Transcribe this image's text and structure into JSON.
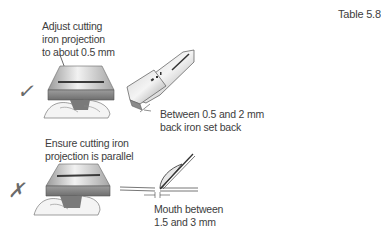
{
  "table_label": "Table 5.8",
  "rows": [
    {
      "status": "correct",
      "status_symbol": "✓",
      "caption": [
        "Adjust cutting",
        "iron projection",
        "to about 0.5 mm"
      ],
      "secondary_caption": [
        "Between 0.5 and 2 mm",
        "back iron set back"
      ]
    },
    {
      "status": "incorrect",
      "status_symbol": "✗",
      "caption": [
        "Ensure cutting iron",
        "projection is parallel"
      ],
      "secondary_caption": [
        "Mouth between",
        "1.5 and 3 mm"
      ]
    }
  ],
  "colors": {
    "text": "#3d3d3d",
    "metal_light": "#e6e6e6",
    "metal_dark": "#8a8a8a",
    "outline": "#555555"
  }
}
